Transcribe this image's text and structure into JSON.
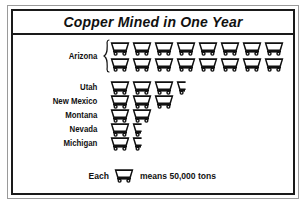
{
  "figure": {
    "title": "Copper Mined in One Year",
    "legend_prefix": "Each",
    "legend_suffix": "means 50,000 tons",
    "icon_name": "mine-cart-icon",
    "brace_name": "curly-brace"
  },
  "chart_data": {
    "type": "bar",
    "subtype": "pictograph",
    "title": "Copper Mined in One Year",
    "xlabel": "",
    "ylabel": "",
    "unit_label": "Each mine cart means 50,000 tons",
    "unit_value": 50000,
    "unit_text": "50,000 tons",
    "icon": "mine-cart",
    "categories": [
      "Arizona",
      "Utah",
      "New Mexico",
      "Montana",
      "Nevada",
      "Michigan"
    ],
    "icon_counts": [
      16,
      3.5,
      3,
      2,
      1.5,
      1.5
    ],
    "values": [
      800000,
      175000,
      150000,
      100000,
      75000,
      75000
    ],
    "grid": false,
    "legend_position": "bottom",
    "rows": [
      {
        "label": "Arizona",
        "icons": 16,
        "full": 16,
        "half": 0,
        "lines": [
          8,
          8
        ],
        "braced": true,
        "value": 800000
      },
      {
        "label": "Utah",
        "icons": 3.5,
        "full": 3,
        "half": 1,
        "lines": [
          3.5
        ],
        "braced": false,
        "value": 175000
      },
      {
        "label": "New Mexico",
        "icons": 3,
        "full": 3,
        "half": 0,
        "lines": [
          3
        ],
        "braced": false,
        "value": 150000
      },
      {
        "label": "Montana",
        "icons": 2,
        "full": 2,
        "half": 0,
        "lines": [
          2
        ],
        "braced": false,
        "value": 100000
      },
      {
        "label": "Nevada",
        "icons": 1.5,
        "full": 1,
        "half": 1,
        "lines": [
          1.5
        ],
        "braced": false,
        "value": 75000
      },
      {
        "label": "Michigan",
        "icons": 1.5,
        "full": 1,
        "half": 1,
        "lines": [
          1.5
        ],
        "braced": false,
        "value": 75000
      }
    ]
  },
  "colors": {
    "ink": "#111111",
    "frame_outer": "#9a9a9a",
    "frame_inner": "#1a1a1a",
    "background": "#ffffff"
  }
}
